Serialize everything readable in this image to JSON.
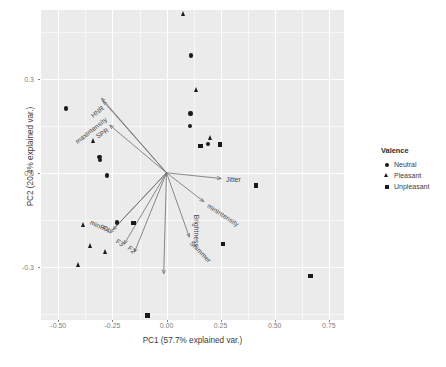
{
  "chart_data": {
    "type": "scatter",
    "subtype": "pca-biplot",
    "title": "",
    "xlabel": "PC1 (57.7% explained var.)",
    "ylabel": "PC2 (20.4% explained var.)",
    "xlim": [
      -0.58,
      0.82
    ],
    "ylim": [
      -0.47,
      0.52
    ],
    "xticks": [
      "-0.50",
      "-0.25",
      "0.00",
      "0.25",
      "0.50",
      "0.75"
    ],
    "xtick_values": [
      -0.5,
      -0.25,
      0.0,
      0.25,
      0.5,
      0.75
    ],
    "yticks": [
      "0.3",
      "0.0",
      "-0.3"
    ],
    "ytick_values": [
      0.3,
      0.0,
      -0.3
    ],
    "grid": true,
    "grid_color": "#ffffff",
    "panel_background": "#ebebeb",
    "legend_position": "right",
    "legend": {
      "title": "Valence",
      "entries": [
        {
          "label": "Neutral",
          "shape": "circle"
        },
        {
          "label": "Pleasant",
          "shape": "triangle"
        },
        {
          "label": "Unpleasant",
          "shape": "square"
        }
      ]
    },
    "series": [
      {
        "name": "Neutral",
        "shape": "circle",
        "points": [
          {
            "x": -0.465,
            "y": 0.205
          },
          {
            "x": -0.31,
            "y": 0.05
          },
          {
            "x": -0.307,
            "y": 0.042
          },
          {
            "x": -0.276,
            "y": -0.008
          },
          {
            "x": 0.112,
            "y": 0.375
          },
          {
            "x": 0.11,
            "y": 0.19
          },
          {
            "x": 0.108,
            "y": 0.15
          },
          {
            "x": 0.19,
            "y": 0.092
          },
          {
            "x": -0.228,
            "y": -0.158
          }
        ]
      },
      {
        "name": "Pleasant",
        "shape": "triangle",
        "points": [
          {
            "x": 0.078,
            "y": 0.508
          },
          {
            "x": 0.138,
            "y": 0.265
          },
          {
            "x": 0.205,
            "y": 0.112
          },
          {
            "x": -0.338,
            "y": 0.103
          },
          {
            "x": -0.382,
            "y": -0.168
          },
          {
            "x": -0.352,
            "y": -0.232
          },
          {
            "x": -0.283,
            "y": -0.254
          },
          {
            "x": -0.405,
            "y": -0.295
          }
        ]
      },
      {
        "name": "Unpleasant",
        "shape": "square",
        "points": [
          {
            "x": 0.248,
            "y": 0.09
          },
          {
            "x": 0.157,
            "y": 0.085
          },
          {
            "x": 0.412,
            "y": -0.04
          },
          {
            "x": -0.152,
            "y": -0.16
          },
          {
            "x": 0.262,
            "y": -0.228
          },
          {
            "x": 0.665,
            "y": -0.33
          },
          {
            "x": -0.088,
            "y": -0.455
          }
        ]
      }
    ],
    "loadings": [
      {
        "label": "maxIntensity",
        "x": -0.3,
        "y": 0.238,
        "label_angle": -38
      },
      {
        "label": "HNR",
        "x": -0.292,
        "y": 0.228,
        "label_angle": -38
      },
      {
        "label": "SPR",
        "x": -0.262,
        "y": 0.152,
        "label_angle": -32
      },
      {
        "label": "minF0",
        "x": -0.262,
        "y": -0.192,
        "label_angle": 24
      },
      {
        "label": "F4",
        "x": -0.248,
        "y": -0.182,
        "label_angle": 24
      },
      {
        "label": "F3",
        "x": -0.196,
        "y": -0.228,
        "label_angle": 33
      },
      {
        "label": "F2",
        "x": -0.148,
        "y": -0.253,
        "label_angle": 40
      },
      {
        "label": "Jitter",
        "x": 0.252,
        "y": -0.018,
        "label_angle": 0
      },
      {
        "label": "minIntensity",
        "x": 0.172,
        "y": -0.092,
        "label_angle": 33
      },
      {
        "label": "Shimmer",
        "x": 0.105,
        "y": -0.205,
        "label_angle": 45
      },
      {
        "label": "Brightness",
        "x": -0.013,
        "y": -0.322,
        "label_angle": 90
      }
    ],
    "arrow_color": "#6d6d6d",
    "point_color": "#1a1a1a"
  }
}
